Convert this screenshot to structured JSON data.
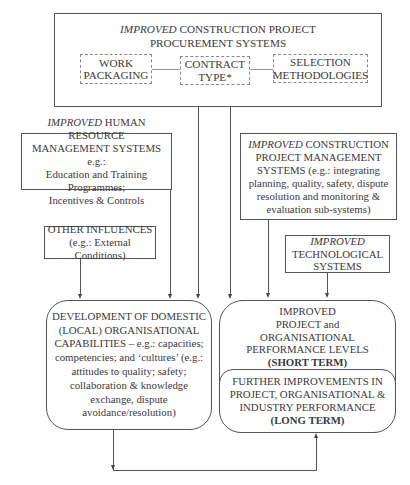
{
  "procurement": {
    "title_italic": "IMPROVED",
    "title_rest": " CONSTRUCTION PROJECT",
    "title_line2": "PROCUREMENT SYSTEMS",
    "components": [
      {
        "line1": "WORK",
        "line2": "PACKAGING"
      },
      {
        "line1": "CONTRACT",
        "line2": "TYPE*"
      },
      {
        "line1": "SELECTION",
        "line2": "METHODOLOGIES"
      }
    ]
  },
  "hr": {
    "italic": "IMPROVED",
    "line1_rest": " HUMAN RESOURCE",
    "line2": "MANAGEMENT SYSTEMS e.g.:",
    "line3": "Education and Training Programmes;",
    "line4": "Incentives & Controls"
  },
  "pm": {
    "italic": "IMPROVED",
    "line1_rest": " CONSTRUCTION",
    "line2": "PROJECT MANAGEMENT",
    "line3": "SYSTEMS (e.g.: integrating",
    "line4": "planning, quality, safety, dispute",
    "line5": "resolution and monitoring &",
    "line6": "evaluation sub-systems)"
  },
  "other": {
    "line1": "OTHER INFLUENCES",
    "line2": "(e.g.: External Conditions)"
  },
  "tech": {
    "italic": "IMPROVED",
    "line2": "TECHNOLOGICAL",
    "line3": "SYSTEMS"
  },
  "development": {
    "lines": [
      "DEVELOPMENT OF DOMESTIC",
      "(LOCAL) ORGANISATIONAL",
      "CAPABILITIES – e.g.: capacities;",
      "competencies; and ‘cultures’ (e.g.:",
      "attitudes to quality; safety;",
      "collaboration & knowledge",
      "exchange, dispute",
      "avoidance/resolution)"
    ]
  },
  "short_term": {
    "lines": [
      "IMPROVED",
      "PROJECT and",
      "ORGANISATIONAL",
      "PERFORMANCE LEVELS"
    ],
    "term": "(SHORT TERM)"
  },
  "long_term": {
    "lines": [
      "FURTHER IMPROVEMENTS IN",
      "PROJECT, ORGANISATIONAL &",
      "INDUSTRY PERFORMANCE"
    ],
    "term": "(LONG TERM)"
  }
}
